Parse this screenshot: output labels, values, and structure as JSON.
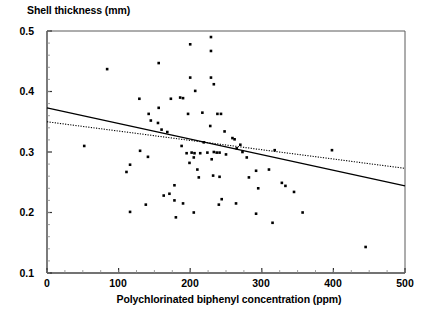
{
  "chart_data": {
    "type": "scatter",
    "title": "",
    "xlabel": "Polychlorinated biphenyl concentration (ppm)",
    "ylabel": "Shell thickness (mm)",
    "xlim": [
      0,
      500
    ],
    "ylim": [
      0.1,
      0.5
    ],
    "xticks": [
      0,
      100,
      200,
      300,
      400,
      500
    ],
    "xtick_labels": [
      "0",
      "100",
      "200",
      "300",
      "400",
      "500"
    ],
    "yticks": [
      0.1,
      0.2,
      0.3,
      0.4,
      0.5
    ],
    "ytick_labels": [
      "0.1",
      "0.2",
      "0.3",
      "0.4",
      "0.5"
    ],
    "minor_tick_interval_y": 0.02,
    "minor_tick_interval_x": 25,
    "grid": false,
    "legend": null,
    "marker": "filled-square",
    "marker_color": "#000000",
    "points": [
      {
        "x": 52,
        "y": 0.31
      },
      {
        "x": 84,
        "y": 0.437
      },
      {
        "x": 116,
        "y": 0.279
      },
      {
        "x": 141,
        "y": 0.292
      },
      {
        "x": 130,
        "y": 0.302
      },
      {
        "x": 116,
        "y": 0.201
      },
      {
        "x": 138,
        "y": 0.213
      },
      {
        "x": 111,
        "y": 0.267
      },
      {
        "x": 142,
        "y": 0.363
      },
      {
        "x": 155,
        "y": 0.348
      },
      {
        "x": 129,
        "y": 0.388
      },
      {
        "x": 145,
        "y": 0.352
      },
      {
        "x": 156,
        "y": 0.373
      },
      {
        "x": 160,
        "y": 0.337
      },
      {
        "x": 168,
        "y": 0.333
      },
      {
        "x": 163,
        "y": 0.228
      },
      {
        "x": 171,
        "y": 0.231
      },
      {
        "x": 178,
        "y": 0.245
      },
      {
        "x": 178,
        "y": 0.22
      },
      {
        "x": 180,
        "y": 0.192
      },
      {
        "x": 156,
        "y": 0.447
      },
      {
        "x": 173,
        "y": 0.388
      },
      {
        "x": 186,
        "y": 0.39
      },
      {
        "x": 190,
        "y": 0.389
      },
      {
        "x": 197,
        "y": 0.363
      },
      {
        "x": 200,
        "y": 0.478
      },
      {
        "x": 200,
        "y": 0.423
      },
      {
        "x": 229,
        "y": 0.49
      },
      {
        "x": 229,
        "y": 0.467
      },
      {
        "x": 229,
        "y": 0.423
      },
      {
        "x": 207,
        "y": 0.401
      },
      {
        "x": 188,
        "y": 0.31
      },
      {
        "x": 195,
        "y": 0.298
      },
      {
        "x": 202,
        "y": 0.299
      },
      {
        "x": 206,
        "y": 0.298
      },
      {
        "x": 214,
        "y": 0.298
      },
      {
        "x": 219,
        "y": 0.316
      },
      {
        "x": 224,
        "y": 0.299
      },
      {
        "x": 230,
        "y": 0.288
      },
      {
        "x": 237,
        "y": 0.299
      },
      {
        "x": 241,
        "y": 0.299
      },
      {
        "x": 205,
        "y": 0.291
      },
      {
        "x": 212,
        "y": 0.258
      },
      {
        "x": 232,
        "y": 0.261
      },
      {
        "x": 241,
        "y": 0.259
      },
      {
        "x": 233,
        "y": 0.3
      },
      {
        "x": 244,
        "y": 0.222
      },
      {
        "x": 210,
        "y": 0.271
      },
      {
        "x": 199,
        "y": 0.282
      },
      {
        "x": 217,
        "y": 0.365
      },
      {
        "x": 228,
        "y": 0.343
      },
      {
        "x": 233,
        "y": 0.412
      },
      {
        "x": 238,
        "y": 0.363
      },
      {
        "x": 243,
        "y": 0.363
      },
      {
        "x": 248,
        "y": 0.334
      },
      {
        "x": 250,
        "y": 0.296
      },
      {
        "x": 259,
        "y": 0.323
      },
      {
        "x": 262,
        "y": 0.321
      },
      {
        "x": 265,
        "y": 0.306
      },
      {
        "x": 270,
        "y": 0.312
      },
      {
        "x": 273,
        "y": 0.3
      },
      {
        "x": 279,
        "y": 0.291
      },
      {
        "x": 282,
        "y": 0.258
      },
      {
        "x": 292,
        "y": 0.269
      },
      {
        "x": 295,
        "y": 0.24
      },
      {
        "x": 310,
        "y": 0.271
      },
      {
        "x": 318,
        "y": 0.303
      },
      {
        "x": 328,
        "y": 0.249
      },
      {
        "x": 333,
        "y": 0.244
      },
      {
        "x": 345,
        "y": 0.234
      },
      {
        "x": 190,
        "y": 0.215
      },
      {
        "x": 205,
        "y": 0.2
      },
      {
        "x": 240,
        "y": 0.213
      },
      {
        "x": 264,
        "y": 0.215
      },
      {
        "x": 292,
        "y": 0.198
      },
      {
        "x": 357,
        "y": 0.2
      },
      {
        "x": 315,
        "y": 0.183
      },
      {
        "x": 398,
        "y": 0.303
      },
      {
        "x": 445,
        "y": 0.143
      }
    ],
    "trend_lines": [
      {
        "name": "regression-line-solid",
        "style": "solid",
        "color": "#000000",
        "x0": 0,
        "y0": 0.373,
        "x1": 500,
        "y1": 0.244
      },
      {
        "name": "regression-line-dotted",
        "style": "dotted",
        "color": "#000000",
        "x0": 0,
        "y0": 0.35,
        "x1": 500,
        "y1": 0.273
      }
    ]
  },
  "axes": {
    "x_axis_title": "Polychlorinated biphenyl concentration (ppm)",
    "y_axis_title": "Shell thickness (mm)",
    "x_tick_labels": [
      "0",
      "100",
      "200",
      "300",
      "400",
      "500"
    ],
    "y_tick_labels": [
      "0.5",
      "0.4",
      "0.3",
      "0.2",
      "0.1"
    ]
  },
  "colors": {
    "background": "#ffffff",
    "foreground": "#000000",
    "frame": "#5a5a5a",
    "marker": "#000000"
  }
}
